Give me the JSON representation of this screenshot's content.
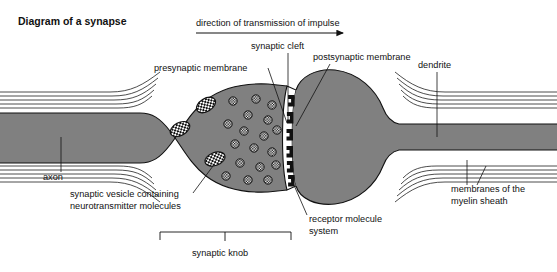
{
  "title": "Diagram of a synapse",
  "colors": {
    "cytoplasm_gray": "#808080",
    "outline_black": "#111111",
    "background_white": "#ffffff",
    "cleft_white": "#ffffff",
    "receptor_black": "#111111"
  },
  "labels": {
    "direction": "direction of transmission of impulse",
    "synaptic_cleft": "synaptic cleft",
    "presynaptic_membrane": "presynaptic membrane",
    "postsynaptic_membrane": "postsynaptic membrane",
    "dendrite": "dendrite",
    "axon": "axon",
    "vesicle_line1": "synaptic vesicle containing",
    "vesicle_line2": "neurotransmitter molecules",
    "receptor_line1": "receptor molecule",
    "receptor_line2": "system",
    "myelin_line1": "membranes of the",
    "myelin_line2": "myelin sheath",
    "synaptic_knob": "synaptic knob"
  },
  "diagram_data": {
    "type": "biological-schematic",
    "subject": "chemical synapse between a myelinated axon terminal and a postsynaptic neuron",
    "structures": [
      "myelinated axon (left)",
      "synaptic knob / terminal bouton",
      "presynaptic membrane",
      "synaptic cleft",
      "postsynaptic membrane with receptor molecules",
      "postsynaptic cell body",
      "myelinated dendrite (right)"
    ],
    "impulse_direction": "left to right",
    "vesicles": [
      {
        "cx": 180,
        "cy": 129,
        "rx": 10.5,
        "ry": 6.5,
        "rot": -28
      },
      {
        "cx": 206,
        "cy": 105,
        "rx": 10.5,
        "ry": 6.5,
        "rot": -32
      },
      {
        "cx": 215,
        "cy": 159,
        "rx": 10.5,
        "ry": 6.5,
        "rot": -20
      }
    ],
    "neurotransmitter_molecules": [
      {
        "cx": 233,
        "cy": 101,
        "r": 4.2
      },
      {
        "cx": 256,
        "cy": 99,
        "r": 4.2
      },
      {
        "cx": 272,
        "cy": 105,
        "r": 4.2
      },
      {
        "cx": 248,
        "cy": 115,
        "r": 4.2
      },
      {
        "cx": 268,
        "cy": 120,
        "r": 4.2
      },
      {
        "cx": 228,
        "cy": 124,
        "r": 4.2
      },
      {
        "cx": 244,
        "cy": 131,
        "r": 4.2
      },
      {
        "cx": 264,
        "cy": 136,
        "r": 4.2
      },
      {
        "cx": 277,
        "cy": 130,
        "r": 4.2
      },
      {
        "cx": 235,
        "cy": 144,
        "r": 4.2
      },
      {
        "cx": 254,
        "cy": 148,
        "r": 4.2
      },
      {
        "cx": 272,
        "cy": 152,
        "r": 4.2
      },
      {
        "cx": 240,
        "cy": 163,
        "r": 4.2
      },
      {
        "cx": 260,
        "cy": 167,
        "r": 4.2
      },
      {
        "cx": 276,
        "cy": 165,
        "r": 4.2
      },
      {
        "cx": 226,
        "cy": 176,
        "r": 4.2
      },
      {
        "cx": 248,
        "cy": 180,
        "r": 4.2
      },
      {
        "cx": 268,
        "cy": 180,
        "r": 4.2
      }
    ],
    "receptor_count": 6,
    "myelin_layers_left": 5,
    "myelin_layers_right": 5,
    "synaptic_knob_bracket": {
      "x1": 160,
      "x2": 291,
      "y": 232
    }
  }
}
